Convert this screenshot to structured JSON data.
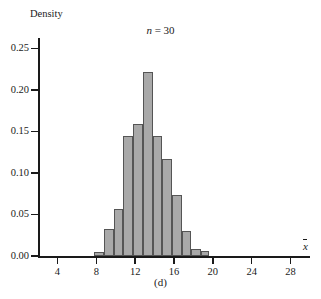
{
  "chart_data": {
    "type": "bar",
    "title": "n = 30",
    "title_italic_part": "n",
    "title_rest": " = 30",
    "caption": "(d)",
    "xlabel": "x̄",
    "xlabel_base": "x",
    "ylabel": "Density",
    "xlim": [
      2,
      30
    ],
    "ylim": [
      0.0,
      0.26
    ],
    "grid": false,
    "legend": "none",
    "bin_width": 1,
    "x_ticks": [
      4,
      8,
      12,
      16,
      20,
      24,
      28
    ],
    "x_tick_labels": [
      "4",
      "8",
      "12",
      "16",
      "20",
      "24",
      "28"
    ],
    "y_ticks": [
      0.0,
      0.05,
      0.1,
      0.15,
      0.2,
      0.25
    ],
    "y_tick_labels": [
      "0.00",
      "0.05",
      "0.10",
      "0.15",
      "0.20",
      "0.25"
    ],
    "bin_edges": [
      7.8,
      8.8,
      9.8,
      10.8,
      11.8,
      12.8,
      13.8,
      14.8,
      15.8,
      16.8,
      17.8,
      18.8,
      19.6
    ],
    "categories": [
      "7.8-8.8",
      "8.8-9.8",
      "9.8-10.8",
      "10.8-11.8",
      "11.8-12.8",
      "12.8-13.8",
      "13.8-14.8",
      "14.8-15.8",
      "15.8-16.8",
      "16.8-17.8",
      "17.8-18.8",
      "18.8-19.6"
    ],
    "values": [
      0.005,
      0.033,
      0.056,
      0.145,
      0.159,
      0.222,
      0.145,
      0.117,
      0.074,
      0.03,
      0.009,
      0.006
    ],
    "bar_fill_color": "#a9a9a9",
    "bar_border_color": "#555555",
    "axis_color": "#1a1a1a",
    "background_color": "#ffffff"
  }
}
